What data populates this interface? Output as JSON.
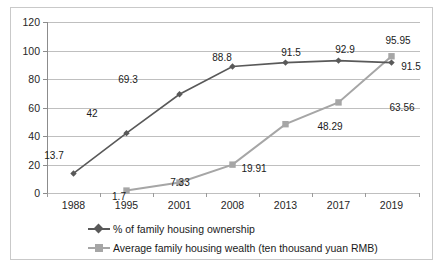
{
  "chart_data": {
    "type": "line",
    "title": "",
    "subtitle": "",
    "xlabel": "",
    "ylabel": "",
    "categories": [
      "1988",
      "1995",
      "2001",
      "2008",
      "2013",
      "2017",
      "2019"
    ],
    "ylim": [
      0,
      120
    ],
    "yticks": [
      0,
      20,
      40,
      60,
      80,
      100,
      120
    ],
    "grid": true,
    "legend_position": "bottom",
    "series": [
      {
        "name": "% of family housing ownership",
        "color": "#595959",
        "marker": "diamond",
        "values": [
          13.7,
          42,
          69.3,
          88.8,
          91.5,
          92.9,
          91.5
        ],
        "labels": [
          "13.7",
          "42",
          "69.3",
          "88.8",
          "91.5",
          "92.9",
          "91.5"
        ]
      },
      {
        "name": "Average family housing wealth (ten thousand yuan RMB)",
        "color": "#a6a6a6",
        "marker": "square",
        "values": [
          null,
          1.7,
          7.33,
          19.91,
          48.29,
          63.56,
          95.95
        ],
        "labels": [
          "",
          "1.7",
          "7.33",
          "19.91",
          "48.29",
          "63.56",
          "95.95"
        ]
      }
    ]
  },
  "axis": {
    "y_tick_labels": [
      "120",
      "100",
      "80",
      "60",
      "40",
      "20",
      "0"
    ],
    "x_tick_labels": [
      "1988",
      "1995",
      "2001",
      "2008",
      "2013",
      "2017",
      "2019"
    ]
  },
  "legend": {
    "items": [
      {
        "label": "% of family housing ownership",
        "color": "#595959",
        "marker": "diamond"
      },
      {
        "label": "Average family housing wealth (ten thousand yuan RMB)",
        "color": "#a6a6a6",
        "marker": "square"
      }
    ]
  },
  "data_labels": {
    "ownership": [
      {
        "text": "13.7",
        "x": 54,
        "y": 155
      },
      {
        "text": "42",
        "x": 92,
        "y": 113
      },
      {
        "text": "69.3",
        "x": 128,
        "y": 79
      },
      {
        "text": "88.8",
        "x": 222,
        "y": 57
      },
      {
        "text": "91.5",
        "x": 291,
        "y": 52
      },
      {
        "text": "92.9",
        "x": 345,
        "y": 49
      },
      {
        "text": "91.5",
        "x": 411,
        "y": 66
      }
    ],
    "wealth": [
      {
        "text": "1.7",
        "x": 119,
        "y": 196
      },
      {
        "text": "7.33",
        "x": 180,
        "y": 182
      },
      {
        "text": "19.91",
        "x": 254,
        "y": 168
      },
      {
        "text": "48.29",
        "x": 330,
        "y": 126
      },
      {
        "text": "63.56",
        "x": 402,
        "y": 107
      },
      {
        "text": "95.95",
        "x": 398,
        "y": 40
      }
    ]
  },
  "colors": {
    "series_dark": "#595959",
    "series_light": "#a6a6a6",
    "gridline": "#bfbfbf",
    "axis": "#8c8c8c",
    "frame": "#c9c9c9",
    "text": "#262626",
    "background": "#ffffff"
  }
}
